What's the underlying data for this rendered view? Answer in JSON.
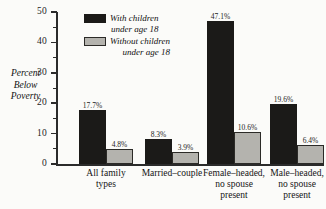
{
  "chart_data": {
    "type": "bar",
    "title": "",
    "xlabel": "",
    "ylabel": "Percent Below Poverty",
    "ylim": [
      0,
      50
    ],
    "y_ticks": [
      0,
      10,
      20,
      30,
      40,
      50
    ],
    "y_tick_labels": [
      "0",
      "10",
      "20",
      "30",
      "40",
      "50"
    ],
    "y_minor_ticks": [
      5,
      15,
      25,
      35,
      45
    ],
    "grid": false,
    "legend_position": "top-center",
    "categories": [
      "All family\ntypes",
      "Married–couple",
      "Female–headed,\nno spouse\npresent",
      "Male–headed,\nno spouse\npresent"
    ],
    "series": [
      {
        "name": "With children\nunder age 18",
        "color": "#1b1a18",
        "values": [
          17.7,
          8.3,
          47.1,
          19.6
        ],
        "value_labels": [
          "17.7%",
          "8.3%",
          "47.1%",
          "19.6%"
        ]
      },
      {
        "name": "Without children\nunder age 18",
        "color": "#b4b3ae",
        "values": [
          4.8,
          3.9,
          10.6,
          6.4
        ],
        "value_labels": [
          "4.8%",
          "3.9%",
          "10.6%",
          "6.4%"
        ]
      }
    ]
  },
  "axis": {
    "y_title_lines": "Percent\nBelow\nPoverty"
  },
  "legend": {
    "items": [
      {
        "label": "With children\nunder age 18",
        "swatch": "dark"
      },
      {
        "label": "Without children\nunder age 18",
        "swatch": "light"
      }
    ]
  }
}
